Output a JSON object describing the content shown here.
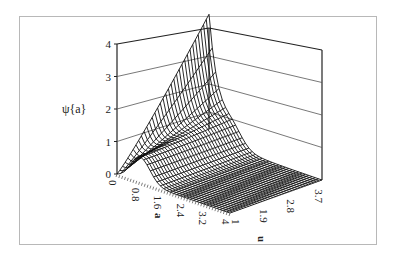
{
  "chart_data": {
    "type": "surface3d",
    "title": "",
    "zlabel": "ψ{a}",
    "xlabel": "a",
    "ylabel": "u",
    "zlim": [
      0,
      4
    ],
    "z_ticks": [
      "0",
      "1",
      "2",
      "3",
      "4"
    ],
    "a_ticks": [
      "0",
      "0.8",
      "1.6",
      "2.4",
      "3.2",
      "4"
    ],
    "u_ticks": [
      "1",
      "1.9",
      "2.8",
      "3.7"
    ],
    "grid": true,
    "samples": {
      "a": [
        0,
        0.8,
        1.6,
        2.4,
        3.2,
        4
      ],
      "u": [
        1,
        1.9,
        2.8,
        3.7,
        4
      ],
      "z": [
        [
          0.0,
          0.0,
          0.0,
          0.0,
          0.0
        ],
        [
          0.8,
          1.2,
          1.0,
          0.7,
          0.6
        ],
        [
          0.3,
          0.3,
          0.2,
          0.1,
          0.1
        ],
        [
          0.05,
          0.05,
          0.03,
          0.02,
          0.02
        ],
        [
          0.01,
          0.01,
          0.0,
          0.0,
          0.0
        ],
        [
          0.0,
          0.0,
          0.0,
          0.0,
          0.0
        ]
      ],
      "edge_a0": {
        "u": [
          1,
          1.9,
          2.8,
          3.7,
          4
        ],
        "z": [
          0.0,
          1.0,
          2.1,
          3.3,
          3.9
        ]
      }
    }
  }
}
